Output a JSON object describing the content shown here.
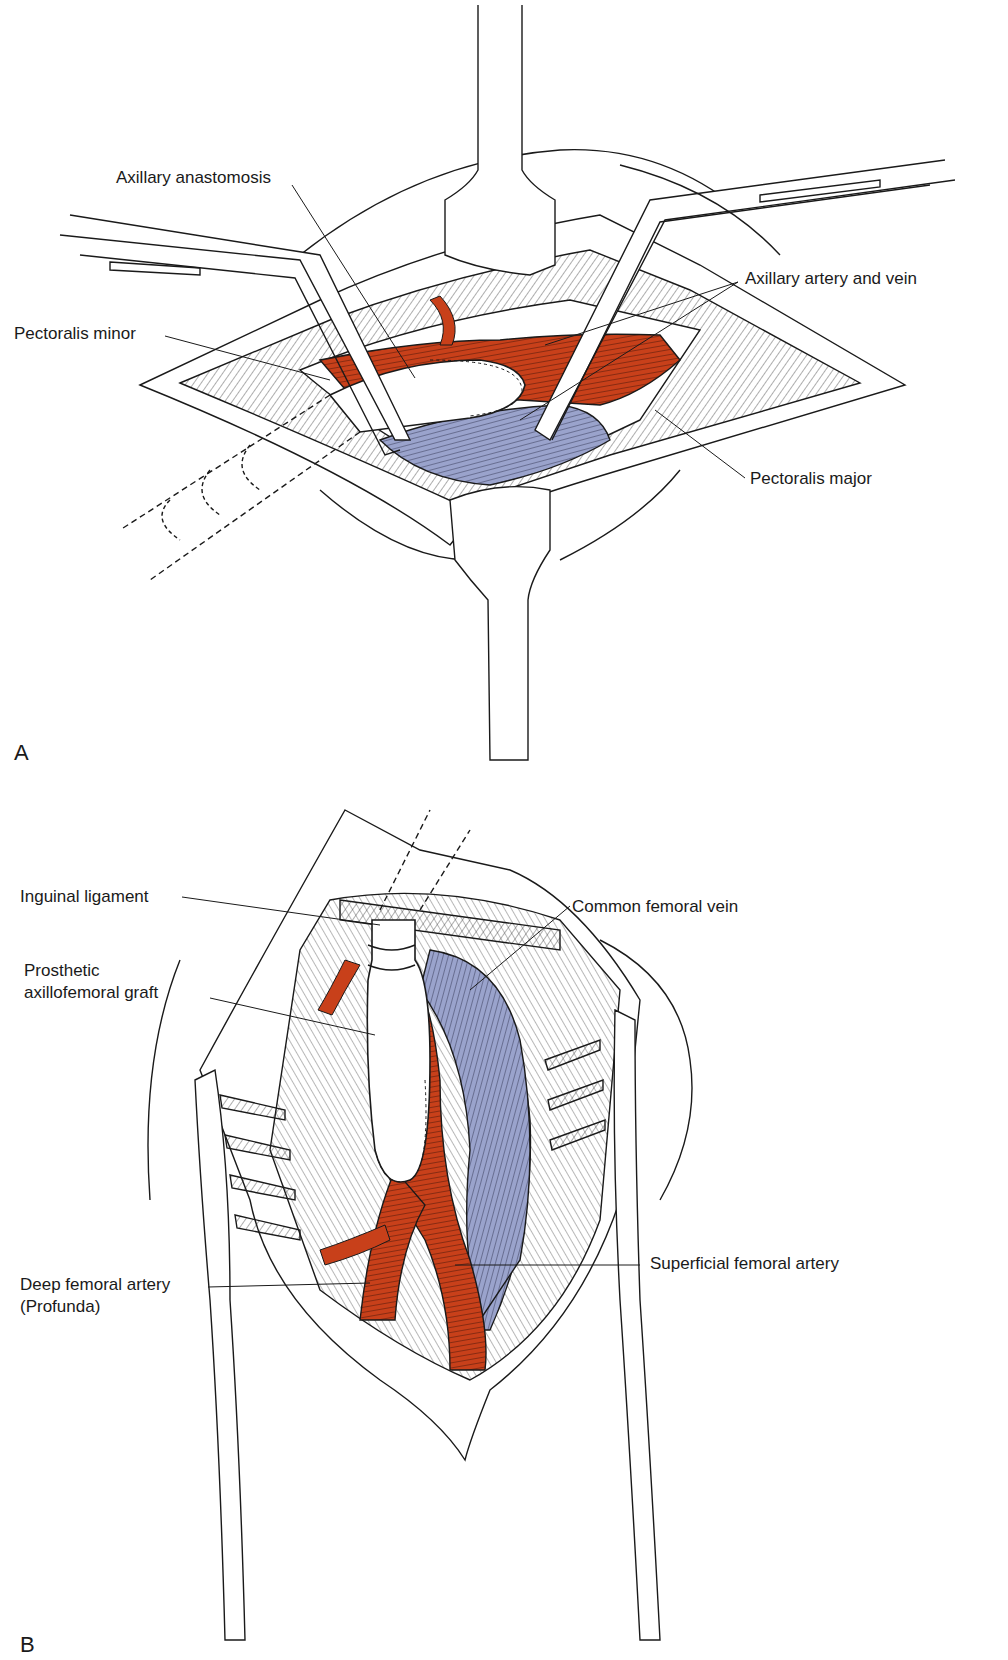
{
  "colors": {
    "artery": "#C8401A",
    "vein": "#9AA3CC",
    "outline": "#1a1a1a",
    "background": "#ffffff",
    "graft": "#ffffff"
  },
  "panel_a": {
    "letter": "A",
    "labels": {
      "axillary_anastomosis": "Axillary anastomosis",
      "pectoralis_minor": "Pectoralis minor",
      "axillary_artery_and_vein": "Axillary artery and vein",
      "pectoralis_major": "Pectoralis major"
    }
  },
  "panel_b": {
    "letter": "B",
    "labels": {
      "inguinal_ligament": "Inguinal ligament",
      "prosthetic_graft_line1": "Prosthetic",
      "prosthetic_graft_line2": "axillofemoral graft",
      "common_femoral_vein": "Common femoral vein",
      "superficial_femoral_artery": "Superficial femoral artery",
      "deep_femoral_artery_line1": "Deep femoral artery",
      "deep_femoral_artery_line2": "(Profunda)"
    }
  }
}
